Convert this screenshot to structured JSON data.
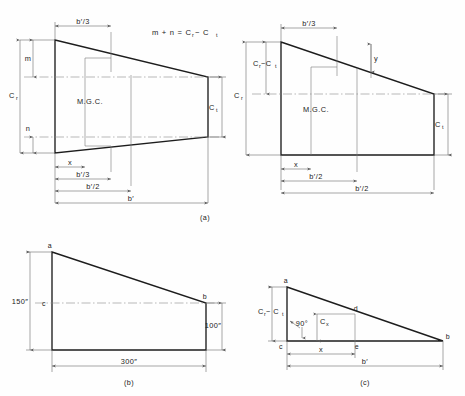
{
  "figure": {
    "background_color": "#fefefe",
    "line_color": "#1d1d1d",
    "dim_color": "#6d6d6d",
    "panels": [
      {
        "id": "a",
        "label": "(a)"
      },
      {
        "id": "b",
        "label": "(b)"
      },
      {
        "id": "c",
        "label": "(c)"
      }
    ]
  },
  "panel_a_left": {
    "equation": "m + n = C",
    "equation_sub1": "r",
    "equation_mid": " − C",
    "equation_sub2": "t",
    "labels": {
      "mgc": "M.G.C.",
      "m": "m",
      "n": "n",
      "c_root": "C",
      "c_root_sub": "r",
      "c_tip": "C",
      "c_tip_sub": "t",
      "b_over_3_top": "b′/3",
      "x": "x",
      "b_over_3_bottom": "b′/3",
      "b_over_2": "b′/2",
      "b_prime": "b′"
    }
  },
  "panel_a_right": {
    "labels": {
      "mgc": "M.G.C.",
      "y": "y",
      "c_root_minus_tip": "C",
      "c_root_minus_tip_sub1": "r",
      "c_root_minus_tip_mid": " −C",
      "c_root_minus_tip_sub2": "t",
      "c_root": "C",
      "c_root_sub": "r",
      "c_tip": "C",
      "c_tip_sub": "t",
      "b_over_3_top": "b′/3",
      "x": "x",
      "b_over_2_inner": "b′/2",
      "b_over_2_outer": "b′/2"
    }
  },
  "panel_b": {
    "label": "(b)",
    "points": {
      "a": "a",
      "b": "b",
      "c": "c"
    },
    "dimensions": {
      "root_chord": "150″",
      "tip_chord": "100″",
      "span": "300″"
    }
  },
  "panel_c": {
    "label": "(c)",
    "points": {
      "a": "a",
      "b": "b",
      "c": "c",
      "d": "d",
      "e": "e"
    },
    "labels": {
      "c_root_minus_tip": "C",
      "c_root_minus_tip_sub1": "r",
      "c_root_minus_tip_mid": " − C",
      "c_root_minus_tip_sub2": "t",
      "right_angle": "90°",
      "c_x": "C",
      "c_x_sub": "x",
      "x": "x",
      "b_prime": "b′"
    }
  }
}
